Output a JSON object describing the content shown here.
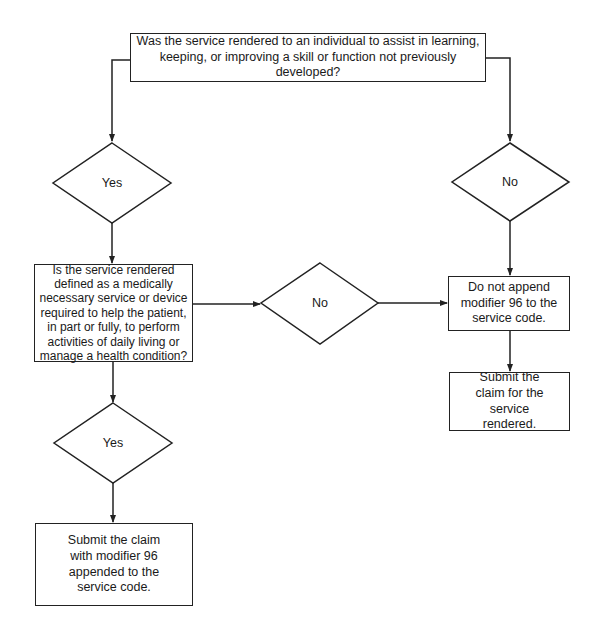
{
  "nodes": {
    "q1": {
      "text": "Was the service rendered to an individual to assist in learning, keeping, or improving a skill or function not previously developed?"
    },
    "d_yes1": {
      "label": "Yes"
    },
    "d_no1": {
      "label": "No"
    },
    "q2": {
      "text": "Is the service rendered defined as a medically necessary service or device required to help the patient, in part or fully, to perform activities of daily living or manage a health condition?"
    },
    "d_no2": {
      "label": "No"
    },
    "r_no_append": {
      "text": "Do not append modifier 96 to the service code."
    },
    "r_submit_plain": {
      "text": "Submit the claim for the service rendered."
    },
    "d_yes2": {
      "label": "Yes"
    },
    "r_submit_96": {
      "text": "Submit the claim with modifier 96 appended to the service code."
    }
  },
  "colors": {
    "stroke": "#222222",
    "background": "#ffffff"
  }
}
